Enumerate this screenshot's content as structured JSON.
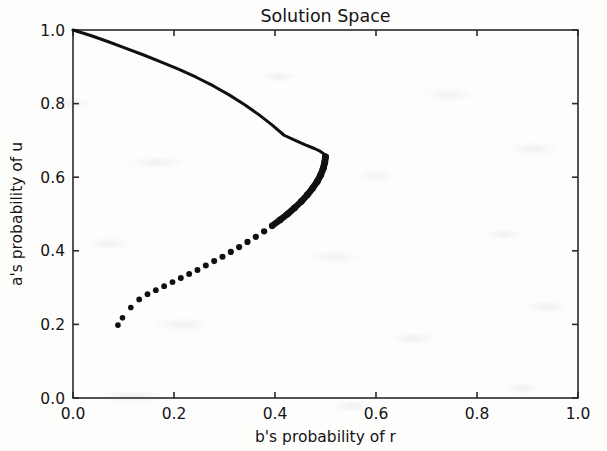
{
  "chart_data": {
    "type": "line",
    "title": "Solution Space",
    "xlabel": "b's probability of r",
    "ylabel": "a's probability of u",
    "xlim": [
      0.0,
      1.0
    ],
    "ylim": [
      0.0,
      1.0
    ],
    "grid": false,
    "legend": null,
    "legend_position": "none",
    "xticks": [
      "0.0",
      "0.2",
      "0.4",
      "0.6",
      "0.8",
      "1.0"
    ],
    "xtick_values": [
      0.0,
      0.2,
      0.4,
      0.6,
      0.8,
      1.0
    ],
    "yticks": [
      "0.0",
      "0.2",
      "0.4",
      "0.6",
      "0.8",
      "1.0"
    ],
    "ytick_values": [
      0.0,
      0.2,
      0.4,
      0.6,
      0.8,
      1.0
    ],
    "series": [
      {
        "name": "upper-branch",
        "style": "solid-dense-markers",
        "color": "#101010",
        "linewidth": 3.0,
        "points": [
          [
            0.0,
            1.0
          ],
          [
            0.035,
            0.985
          ],
          [
            0.07,
            0.968
          ],
          [
            0.105,
            0.95
          ],
          [
            0.14,
            0.932
          ],
          [
            0.175,
            0.913
          ],
          [
            0.21,
            0.893
          ],
          [
            0.245,
            0.871
          ],
          [
            0.278,
            0.848
          ],
          [
            0.31,
            0.823
          ],
          [
            0.34,
            0.797
          ],
          [
            0.368,
            0.77
          ],
          [
            0.394,
            0.742
          ],
          [
            0.418,
            0.714
          ],
          [
            0.44,
            0.7
          ],
          [
            0.46,
            0.688
          ],
          [
            0.478,
            0.678
          ],
          [
            0.49,
            0.67
          ],
          [
            0.498,
            0.662
          ],
          [
            0.5,
            0.655
          ]
        ]
      },
      {
        "name": "lower-branch",
        "style": "dotted-markers",
        "color": "#101010",
        "markersize": 3.4,
        "points": [
          [
            0.5,
            0.655
          ],
          [
            0.4985,
            0.64
          ],
          [
            0.4955,
            0.624
          ],
          [
            0.4905,
            0.606
          ],
          [
            0.4835,
            0.588
          ],
          [
            0.4745,
            0.57
          ],
          [
            0.464,
            0.552
          ],
          [
            0.452,
            0.534
          ],
          [
            0.439,
            0.517
          ],
          [
            0.425,
            0.5
          ],
          [
            0.41,
            0.484
          ],
          [
            0.3945,
            0.468
          ],
          [
            0.3785,
            0.453
          ],
          [
            0.362,
            0.438
          ],
          [
            0.3455,
            0.424
          ],
          [
            0.329,
            0.41
          ],
          [
            0.3125,
            0.397
          ],
          [
            0.296,
            0.384
          ],
          [
            0.2795,
            0.372
          ],
          [
            0.263,
            0.36
          ],
          [
            0.2465,
            0.348
          ],
          [
            0.23,
            0.337
          ],
          [
            0.2135,
            0.326
          ],
          [
            0.197,
            0.315
          ],
          [
            0.1805,
            0.304
          ],
          [
            0.164,
            0.293
          ],
          [
            0.1475,
            0.282
          ],
          [
            0.131,
            0.268
          ],
          [
            0.1145,
            0.246
          ],
          [
            0.098,
            0.218
          ],
          [
            0.089,
            0.198
          ]
        ]
      }
    ]
  },
  "figure": {
    "background_color": "#fdfdfc",
    "axis_color": "#2a2a2a",
    "text_color": "#141414",
    "curve_color": "#101010"
  }
}
